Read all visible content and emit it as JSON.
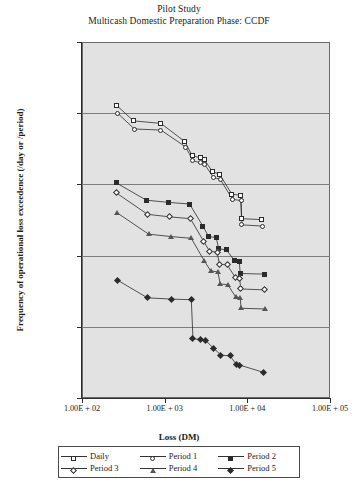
{
  "title": {
    "line1": "Pilot Study",
    "line2": "Multicash Domestic Preparation Phase: CCDF"
  },
  "axes": {
    "ylabel": "Frequency of operational loss exceedence (/day or /period)",
    "xlabel": "Loss (DM)",
    "yticks": [
      "1.00E + 01",
      "1.00E + 00",
      "1.00E − 01",
      "1.00E − 02",
      "1.00E − 03",
      "1.00E − 04"
    ],
    "xticks": [
      "1.00E + 02",
      "1.00E + 03",
      "1.00E + 04",
      "1.00E + 05"
    ]
  },
  "legend": {
    "items": [
      {
        "label": "Daily",
        "marker": "square-open"
      },
      {
        "label": "Period 1",
        "marker": "circle-open"
      },
      {
        "label": "Period 2",
        "marker": "square-filled"
      },
      {
        "label": "Period 3",
        "marker": "diamond-open"
      },
      {
        "label": "Period 4",
        "marker": "triangle-open"
      },
      {
        "label": "Period 5",
        "marker": "diamond-filled"
      }
    ]
  },
  "style": {
    "plot_background": "#e2e2e2",
    "gridline_color": "#7d7d7d",
    "axis_color": "#2b2b2b",
    "series_color": "#2b2b2b",
    "page_background": "#ffffff"
  },
  "chart_data": {
    "type": "line",
    "xlabel": "Loss (DM)",
    "ylabel": "Frequency of operational loss exceedence (/day or /period)",
    "xscale": "log",
    "yscale": "log",
    "xlim": [
      100,
      100000
    ],
    "ylim": [
      0.0001,
      10
    ],
    "grid": "horizontal-decades",
    "legend_position": "below-axis",
    "series": [
      {
        "name": "Daily",
        "marker": "square-open",
        "points": [
          [
            260,
            1.3
          ],
          [
            420,
            0.78
          ],
          [
            900,
            0.72
          ],
          [
            1750,
            0.4
          ],
          [
            2150,
            0.255
          ],
          [
            2700,
            0.235
          ],
          [
            3000,
            0.225
          ],
          [
            3800,
            0.15
          ],
          [
            4600,
            0.14
          ],
          [
            6500,
            0.073
          ],
          [
            8300,
            0.07
          ],
          [
            8500,
            0.033
          ],
          [
            15000,
            0.032
          ]
        ]
      },
      {
        "name": "Period 1",
        "marker": "circle-open",
        "points": [
          [
            270,
            1.0
          ],
          [
            430,
            0.6
          ],
          [
            900,
            0.58
          ],
          [
            1800,
            0.335
          ],
          [
            2200,
            0.215
          ],
          [
            2750,
            0.2
          ],
          [
            3050,
            0.19
          ],
          [
            3900,
            0.125
          ],
          [
            4700,
            0.118
          ],
          [
            6600,
            0.062
          ],
          [
            8400,
            0.059
          ],
          [
            8600,
            0.027
          ],
          [
            15200,
            0.026
          ]
        ]
      },
      {
        "name": "Period 2",
        "marker": "square-filled",
        "points": [
          [
            260,
            0.105
          ],
          [
            600,
            0.06
          ],
          [
            1100,
            0.056
          ],
          [
            2000,
            0.053
          ],
          [
            2900,
            0.026
          ],
          [
            3400,
            0.0185
          ],
          [
            4200,
            0.018
          ],
          [
            4500,
            0.0125
          ],
          [
            5600,
            0.012
          ],
          [
            7000,
            0.0085
          ],
          [
            8000,
            0.0082
          ],
          [
            8200,
            0.0056
          ],
          [
            16000,
            0.0055
          ]
        ]
      },
      {
        "name": "Period 3",
        "marker": "diamond-open",
        "points": [
          [
            260,
            0.076
          ],
          [
            620,
            0.038
          ],
          [
            1150,
            0.035
          ],
          [
            2050,
            0.033
          ],
          [
            2950,
            0.016
          ],
          [
            3500,
            0.0115
          ],
          [
            4300,
            0.0112
          ],
          [
            4600,
            0.0076
          ],
          [
            5700,
            0.0074
          ],
          [
            7100,
            0.005
          ],
          [
            8100,
            0.0048
          ],
          [
            8300,
            0.0034
          ],
          [
            16200,
            0.0033
          ]
        ]
      },
      {
        "name": "Period 4",
        "marker": "triangle-open",
        "points": [
          [
            265,
            0.04
          ],
          [
            640,
            0.02
          ],
          [
            1200,
            0.0185
          ],
          [
            2100,
            0.0175
          ],
          [
            3000,
            0.0085
          ],
          [
            3600,
            0.0061
          ],
          [
            4400,
            0.0059
          ],
          [
            4700,
            0.004
          ],
          [
            5800,
            0.0039
          ],
          [
            7200,
            0.00265
          ],
          [
            8200,
            0.00255
          ],
          [
            8400,
            0.00182
          ],
          [
            16400,
            0.00178
          ]
        ]
      },
      {
        "name": "Period 5",
        "marker": "diamond-filled",
        "points": [
          [
            270,
            0.0045
          ],
          [
            620,
            0.00255
          ],
          [
            1200,
            0.00245
          ],
          [
            2100,
            0.0024
          ],
          [
            2200,
            0.00068
          ],
          [
            2700,
            0.00066
          ],
          [
            3100,
            0.00065
          ],
          [
            3900,
            0.0005
          ],
          [
            4800,
            0.0004
          ],
          [
            6200,
            0.00039
          ],
          [
            7300,
            0.0003
          ],
          [
            8100,
            0.00029
          ],
          [
            15500,
            0.00023
          ]
        ]
      }
    ]
  }
}
